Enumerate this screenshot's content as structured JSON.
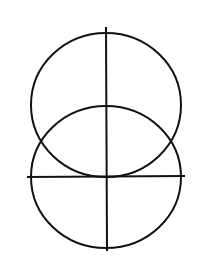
{
  "diagram": {
    "canvas": {
      "width": 211,
      "height": 260,
      "background": "#ffffff"
    },
    "stroke": {
      "color": "#111111",
      "width": 2
    },
    "circles": [
      {
        "name": "upper-circle",
        "cx": 106,
        "cy": 105,
        "rx": 75,
        "ry": 72
      },
      {
        "name": "lower-circle",
        "cx": 106,
        "cy": 177,
        "rx": 75,
        "ry": 71
      }
    ],
    "lines": [
      {
        "name": "vertical-axis",
        "x1": 106,
        "y1": 27,
        "x2": 107,
        "y2": 251
      },
      {
        "name": "horizontal-axis",
        "x1": 27,
        "y1": 177,
        "x2": 185,
        "y2": 176
      }
    ]
  }
}
